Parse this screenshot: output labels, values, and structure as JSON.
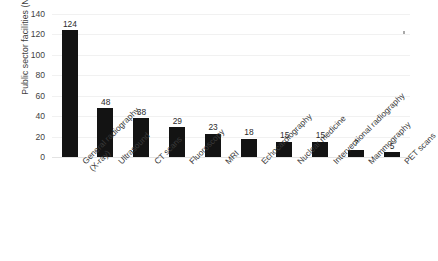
{
  "chart_data": {
    "type": "bar",
    "title": "",
    "xlabel": "",
    "ylabel": "Public sector facilities (N)",
    "ylim": [
      0,
      140
    ],
    "ytick_step": 20,
    "yticks": [
      0,
      20,
      40,
      60,
      80,
      100,
      120,
      140
    ],
    "grid": true,
    "legend": false,
    "bar_color": "#131313",
    "gridline_color": "#f1f1f1",
    "background_color": "#ffffff",
    "show_data_labels": true,
    "category_label_rotation": -45,
    "categories": [
      "General radiography (X-ray)",
      "Ultrasound",
      "CT scans",
      "Fluoroscopy",
      "MRI",
      "Echocardiography",
      "Nuclear medicine",
      "Interventional radiography",
      "Mammography",
      "PET scans"
    ],
    "category_lines": [
      [
        "General radiography",
        "(X-ray)"
      ],
      [
        "Ultrasound"
      ],
      [
        "CT scans"
      ],
      [
        "Fluoroscopy"
      ],
      [
        "MRI"
      ],
      [
        "Echocardiography"
      ],
      [
        "Nuclear medicine"
      ],
      [
        "Interventional radiography"
      ],
      [
        "Mammography"
      ],
      [
        "PET scans"
      ]
    ],
    "values": [
      124,
      48,
      38,
      29,
      23,
      18,
      15,
      15,
      7,
      5
    ],
    "data_labels": [
      "124",
      "48",
      "38",
      "29",
      "23",
      "18",
      "15",
      "15",
      "7",
      "5"
    ]
  },
  "artifacts": {
    "speck_present": true
  }
}
